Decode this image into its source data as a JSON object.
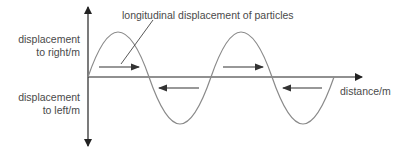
{
  "diagram": {
    "type": "longitudinal-wave",
    "labels": {
      "y_positive_line1": "displacement",
      "y_positive_line2": "to right/m",
      "y_negative_line1": "displacement",
      "y_negative_line2": "to left/m",
      "x_axis": "distance/m",
      "annotation": "longitudinal displacement of particles"
    },
    "colors": {
      "axes": "#222222",
      "wave": "#8a8a8a",
      "arrows": "#333333",
      "text": "#4a4a4a"
    },
    "wave": {
      "periods": 2,
      "start": "origin",
      "first_half": "positive (to right)"
    },
    "direction_arrows": [
      {
        "direction": "right",
        "region": "crest 1"
      },
      {
        "direction": "left",
        "region": "trough 1"
      },
      {
        "direction": "right",
        "region": "crest 2"
      },
      {
        "direction": "left",
        "region": "trough 2"
      }
    ]
  }
}
